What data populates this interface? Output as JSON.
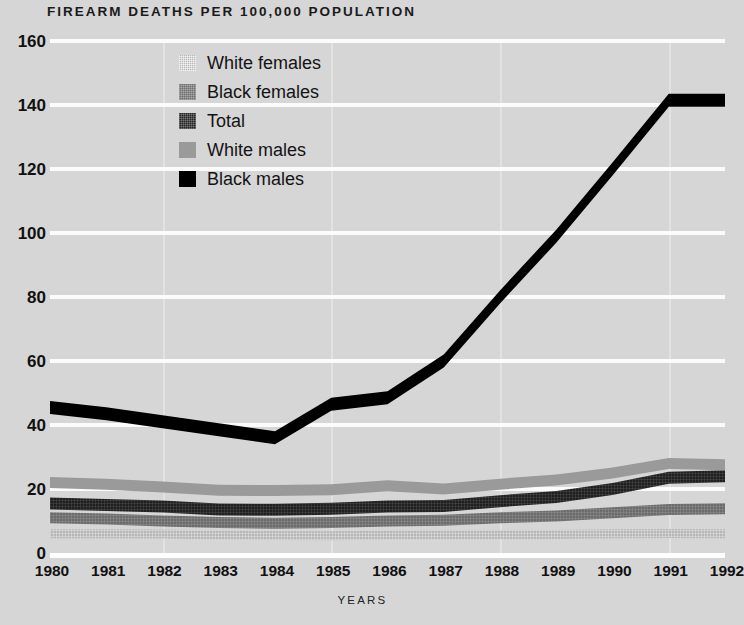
{
  "chart_data": {
    "type": "line",
    "title": "FIREARM DEATHS PER 100,000 POPULATION",
    "xlabel": "YEARS",
    "ylabel": "",
    "x": [
      1980,
      1981,
      1982,
      1983,
      1984,
      1985,
      1986,
      1987,
      1988,
      1989,
      1990,
      1991,
      1992
    ],
    "categories": [
      "1980",
      "1981",
      "1982",
      "1983",
      "1984",
      "1985",
      "1986",
      "1987",
      "1988",
      "1989",
      "1990",
      "1991",
      "1992"
    ],
    "xlim": [
      1980,
      1992
    ],
    "ylim": [
      0,
      160
    ],
    "yticks": [
      0,
      20,
      40,
      60,
      80,
      100,
      120,
      140,
      160
    ],
    "ytick_labels": [
      "0",
      "20",
      "40",
      "60",
      "80",
      "100",
      "120",
      "140",
      "160"
    ],
    "grid": "horizontal",
    "legend_position": "upper-left-inside",
    "series": [
      {
        "name": "White females",
        "color": "#b7b7b7",
        "texture": "cross-hatch-light",
        "values": [
          6.0,
          6.0,
          5.9,
          5.6,
          5.5,
          5.4,
          5.6,
          5.6,
          5.7,
          5.8,
          6.0,
          6.1,
          6.0
        ]
      },
      {
        "name": "Black females",
        "color": "#6e6e6e",
        "texture": "cross-hatch-medium",
        "values": [
          11.0,
          10.6,
          10.0,
          9.5,
          9.3,
          9.5,
          10.0,
          10.2,
          11.0,
          11.6,
          12.6,
          13.6,
          13.8
        ]
      },
      {
        "name": "Total",
        "color": "#242424",
        "texture": "cross-hatch-dark",
        "values": [
          15.5,
          15.0,
          14.5,
          13.6,
          13.5,
          13.8,
          14.5,
          14.7,
          16.2,
          17.5,
          20.0,
          23.5,
          24.0
        ]
      },
      {
        "name": "White males",
        "color": "#9a9a9a",
        "texture": "solid",
        "values": [
          22.0,
          21.5,
          20.6,
          19.6,
          19.5,
          19.8,
          21.0,
          20.0,
          21.5,
          22.8,
          25.0,
          28.0,
          27.6
        ]
      },
      {
        "name": "Black males",
        "color": "#000000",
        "texture": "solid",
        "values": [
          45.5,
          43.5,
          41.0,
          38.5,
          36.0,
          46.5,
          48.5,
          60.0,
          80.0,
          99.0,
          120.0,
          141.5,
          141.5
        ]
      }
    ]
  },
  "legend": {
    "items": [
      {
        "label": "White females",
        "swatch_class": "tex-white-females"
      },
      {
        "label": "Black females",
        "swatch_class": "tex-black-females"
      },
      {
        "label": "Total",
        "swatch_class": "tex-total"
      },
      {
        "label": "White males",
        "swatch_class": "tex-white-males"
      },
      {
        "label": "Black males",
        "swatch_class": "tex-black-males"
      }
    ]
  },
  "colors": {
    "background": "#d6d6d6",
    "gridline": "#fbfbfb",
    "text": "#111111"
  }
}
